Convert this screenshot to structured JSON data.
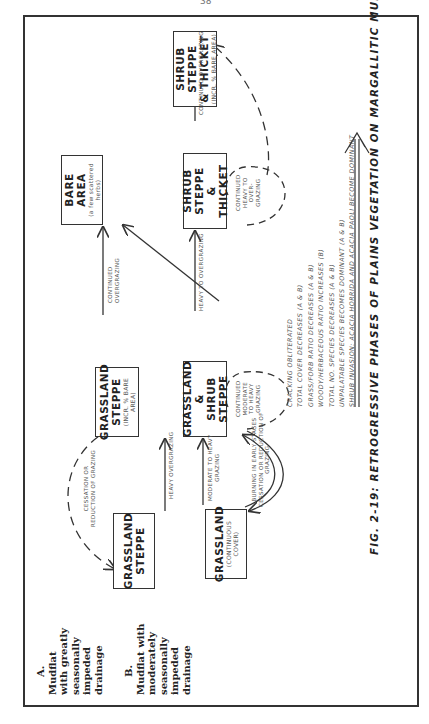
{
  "page": {
    "number": "38"
  },
  "figure": {
    "caption": "FIG. 2-19: RETROGRESSIVE PHASES OF PLAINS VEGETATION ON MARGALLITIC MUDFLATS.",
    "rows": [
      {
        "id": "A",
        "label_lines": [
          "A.",
          "Mudflat",
          "with greatly",
          "seasonally",
          "impeded",
          "drainage"
        ]
      },
      {
        "id": "B",
        "label_lines": [
          "B.",
          "Mudflat with",
          "moderately",
          "seasonally",
          "impeded",
          "drainage"
        ]
      }
    ],
    "nodes": {
      "a1": {
        "title_lines": [
          "GRASSLAND",
          "STEPPE"
        ],
        "sub": ""
      },
      "a2": {
        "title_lines": [
          "GRASSLAND",
          "STEPPE"
        ],
        "sub": "(INCR. % BARE AREA)"
      },
      "a3": {
        "title_lines": [
          "BARE AREA"
        ],
        "sub_lines": [
          "(a few scattered",
          "herbs)"
        ]
      },
      "b1": {
        "title_lines": [
          "GRASSLAND"
        ],
        "sub_lines": [
          "(CONTINUOUS",
          "COVER)"
        ]
      },
      "b2": {
        "title_lines": [
          "GRASSLAND",
          "&",
          "SHRUB STEPPE"
        ],
        "sub": ""
      },
      "b3": {
        "title_lines": [
          "SHRUB STEPPE",
          "&",
          "THICKET"
        ],
        "sub": ""
      },
      "b4": {
        "title_lines": [
          "SHRUB STEPPE",
          "& THICKET"
        ],
        "sub": "(INCR. % BARE AREA)"
      }
    },
    "edges": [
      {
        "from": "a1",
        "to": "a2",
        "label": "HEAVY OVERGRAZING",
        "style": "solid"
      },
      {
        "from": "a2",
        "to": "a1",
        "label_lines": [
          "CESSATION OR",
          "REDUCTION OF GRAZING"
        ],
        "style": "dashed"
      },
      {
        "from": "a2",
        "to": "a3",
        "label_lines": [
          "CONTINUED",
          "OVERGRAZING"
        ],
        "style": "solid"
      },
      {
        "from": "b2",
        "to": "a3",
        "label": "",
        "style": "solid"
      },
      {
        "from": "b1",
        "to": "b2",
        "label_lines": [
          "MODERATE TO HEAVY",
          "GRAZING"
        ],
        "style": "solid"
      },
      {
        "from": "b2",
        "to": "b1",
        "label_lines": [
          "BURNING IN EARLY STAGES",
          "CESSATION OR REDUCTION OF",
          "GRAZING"
        ],
        "style": "solid-curved"
      },
      {
        "from": "b2",
        "to": "b2",
        "label_lines": [
          "CONTINUED",
          "MODERATE",
          "TO HEAVY",
          "GRAZING"
        ],
        "style": "dashed-loop"
      },
      {
        "from": "b2",
        "to": "b3",
        "label": "HEAVY TO OVERGRAZING",
        "style": "solid"
      },
      {
        "from": "b3",
        "to": "b3",
        "label_lines": [
          "CONTINUED",
          "HEAVY TO",
          "OVER-",
          "GRAZING"
        ],
        "style": "dashed-loop"
      },
      {
        "from": "b3",
        "to": "b4",
        "label": "CONTINUED OVERGRAZING",
        "style": "solid"
      },
      {
        "from": "b3",
        "to": "b4",
        "label": "",
        "style": "dashed-curved"
      }
    ],
    "notes": [
      "CRACKING OBLITERATED",
      "TOTAL COVER DECREASES (A & B)",
      "GRASS/FORB RATIO DECREASES (A & B)",
      "WOODY/HERBACEOUS RATIO INCREASES (B)",
      "TOTAL NO. SPECIES DECREASES (A & B)",
      "UNPALATABLE SPECIES BECOMES DOMINANT (A & B)",
      "SHRUB INVASION: ACACIA HORRIDA AND ACACIA PAOLI BECOME DOMINANT"
    ]
  }
}
